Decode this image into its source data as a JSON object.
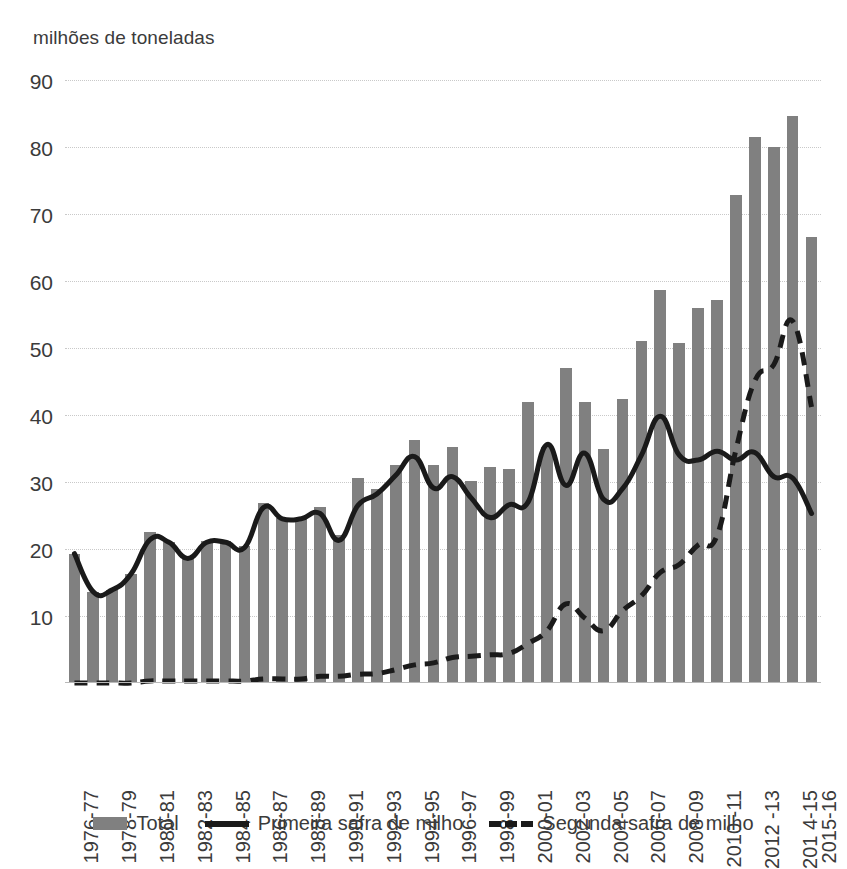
{
  "chart_data": {
    "type": "bar",
    "title": "",
    "subtitle": "",
    "ylabel": "milhões de toneladas",
    "xlabel": "",
    "ylim": [
      0,
      90
    ],
    "yticks": [
      10,
      20,
      30,
      40,
      50,
      60,
      70,
      80,
      90
    ],
    "grid": true,
    "legend_position": "bottom",
    "categories": [
      "1976-77",
      "1977-78",
      "1978-79",
      "1979-80",
      "1980-81",
      "1981-82",
      "1982-83",
      "1983-84",
      "1984-85",
      "1985-86",
      "1986-87",
      "1987-88",
      "1988-89",
      "1989-90",
      "1990-91",
      "1991-92",
      "1992-93",
      "1993-94",
      "1994-95",
      "1995-96",
      "1996-97",
      "1997-98",
      "1998-99",
      "1999-00",
      "2000-01",
      "2001-02",
      "2002-03",
      "2003-04",
      "2004-05",
      "2005-06",
      "2006-07",
      "2007-08",
      "2008-09",
      "2009-10",
      "2010-11",
      "2011-12",
      "2012-13",
      "2013-14",
      "2014-15",
      "2015-16"
    ],
    "xtick_labels": [
      "1976-77",
      "1978-79",
      "1980-81",
      "1982-83",
      "1984-85",
      "1986-87",
      "1988-89",
      "1990-91",
      "1992-93",
      "1994-95",
      "1996-97",
      "1998-99",
      "2000-01",
      "2002-03",
      "2004-05",
      "2006-07",
      "2008-09",
      "2010 -11",
      "2012 -13",
      "201 4-15",
      "2015-16"
    ],
    "xtick_indices": [
      0,
      2,
      4,
      6,
      8,
      10,
      12,
      14,
      16,
      18,
      20,
      22,
      24,
      26,
      28,
      30,
      32,
      34,
      36,
      38,
      39
    ],
    "series": [
      {
        "name": "Total",
        "kind": "bar",
        "color": "#808080",
        "values": [
          19.3,
          13.6,
          13.9,
          16.3,
          22.6,
          21.1,
          18.7,
          21.2,
          21.2,
          20.5,
          26.8,
          24.7,
          24.7,
          26.3,
          22.1,
          30.6,
          29.0,
          32.5,
          36.3,
          32.5,
          35.2,
          30.2,
          32.3,
          32.0,
          41.9,
          35.2,
          47.0,
          42.0,
          35.0,
          42.4,
          51.1,
          58.6,
          50.7,
          56.0,
          57.2,
          72.9,
          81.5,
          80.0,
          84.7,
          66.5
        ]
      },
      {
        "name": "Primeira safra de milho",
        "kind": "line",
        "style": "solid",
        "color": "#1a1a1a",
        "values": [
          19.3,
          13.6,
          13.9,
          16.3,
          21.4,
          21.0,
          18.6,
          21.0,
          21.0,
          20.2,
          26.2,
          24.5,
          24.5,
          25.3,
          21.3,
          26.5,
          28.2,
          31.0,
          33.8,
          29.1,
          30.8,
          27.6,
          24.7,
          26.6,
          27.0,
          35.6,
          29.5,
          34.3,
          27.4,
          29.0,
          34.0,
          39.8,
          34.0,
          33.3,
          34.6,
          33.3,
          34.4,
          30.8,
          30.6,
          25.3
        ]
      },
      {
        "name": "Segunda safra de milho",
        "kind": "line",
        "style": "dashed",
        "color": "#1a1a1a",
        "values": [
          0.0,
          0.0,
          0.0,
          0.0,
          0.3,
          0.3,
          0.3,
          0.3,
          0.3,
          0.3,
          0.6,
          0.6,
          0.6,
          1.0,
          1.0,
          1.3,
          1.4,
          2.0,
          2.7,
          3.0,
          3.8,
          4.0,
          4.2,
          4.4,
          5.9,
          7.8,
          11.8,
          9.7,
          7.8,
          10.8,
          13.0,
          16.5,
          17.7,
          20.6,
          22.0,
          34.8,
          45.1,
          47.5,
          54.0,
          41.2
        ]
      }
    ]
  },
  "legend": {
    "items": [
      {
        "label": "Total",
        "swatch": "bar-swatch"
      },
      {
        "label": "Primeira safra de milho",
        "swatch": "solid-line-swatch"
      },
      {
        "label": "Segunda safra de milho",
        "swatch": "dashed-line-swatch"
      }
    ]
  },
  "axis": {
    "y_unit_caption": "milhões de toneladas"
  },
  "colors": {
    "bar": "#808080",
    "line": "#1a1a1a",
    "gridline": "#c9c9c9",
    "text": "#3b3b3b",
    "background": "#ffffff"
  }
}
